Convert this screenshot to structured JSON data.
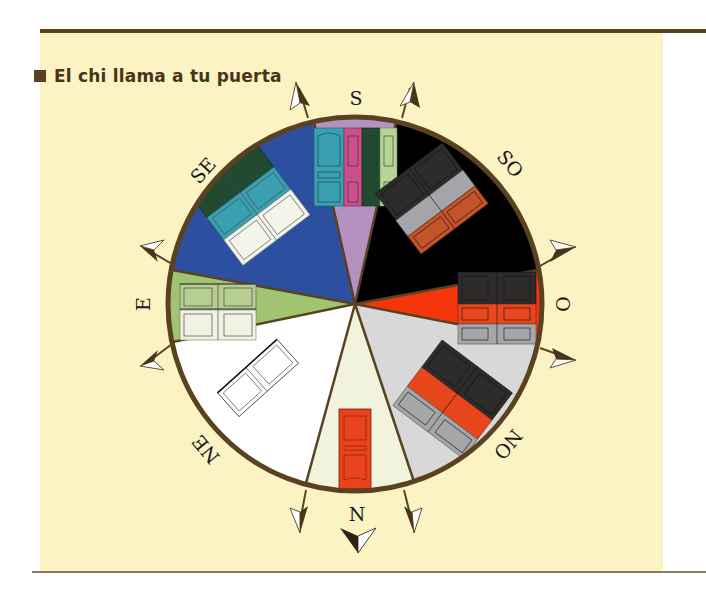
{
  "title": "El chi llama a tu puerta",
  "colors": {
    "panel_bg": "#fbf3c4",
    "rule": "#5a4221",
    "ring": "#5a4221"
  },
  "compass": {
    "directions": [
      {
        "label": "S",
        "sector_color": "#b491c0"
      },
      {
        "label": "SO",
        "sector_color": "#000000"
      },
      {
        "label": "O",
        "sector_color": "#f5350c"
      },
      {
        "label": "NO",
        "sector_color": "#d8d8d8"
      },
      {
        "label": "N",
        "sector_color": "#f1f3dc"
      },
      {
        "label": "NE",
        "sector_color": "#ffffff"
      },
      {
        "label": "E",
        "sector_color": "#a1c470"
      },
      {
        "label": "SE",
        "sector_color": "#2c4fa0"
      }
    ],
    "doors": [
      {
        "sector": "S",
        "colors": [
          "#3a9fb0",
          "#cc4f8a",
          "#224a30",
          "#b9d394"
        ]
      },
      {
        "sector": "SO",
        "colors": [
          "#2e2b2b",
          "#a3a5a8",
          "#c3532b"
        ]
      },
      {
        "sector": "O",
        "colors": [
          "#2e2b2b",
          "#e8471e",
          "#a5a6a8"
        ]
      },
      {
        "sector": "NO",
        "colors": [
          "#2e2b2b",
          "#e8471e",
          "#a5a6a8"
        ]
      },
      {
        "sector": "N",
        "colors": [
          "#e8421f"
        ]
      },
      {
        "sector": "NE",
        "colors": [
          "#ffffff"
        ]
      },
      {
        "sector": "E",
        "colors": [
          "#b6cf90",
          "#f0f2e4"
        ]
      },
      {
        "sector": "SE",
        "colors": [
          "#224a30",
          "#3a9fb0",
          "#f3f4ea"
        ]
      }
    ]
  }
}
